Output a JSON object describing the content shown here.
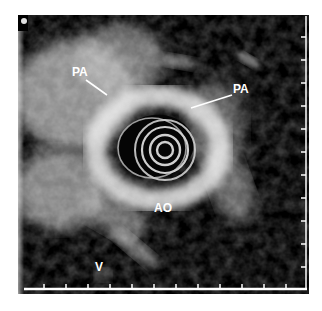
{
  "image": {
    "description": "Intravascular ultrasound cross-section with catheter artifact rings at center",
    "modality": "ultrasound",
    "colors": {
      "background": "#000000",
      "tissue": "#d8d8d8",
      "frame": "#ffffff"
    }
  },
  "labels": [
    {
      "id": "pa-left",
      "text": "PA"
    },
    {
      "id": "pa-right",
      "text": "PA"
    },
    {
      "id": "ao",
      "text": "AO"
    },
    {
      "id": "v",
      "text": "V"
    }
  ],
  "scale": {
    "bottom_tick_count": 12,
    "right_tick_count": 11
  }
}
